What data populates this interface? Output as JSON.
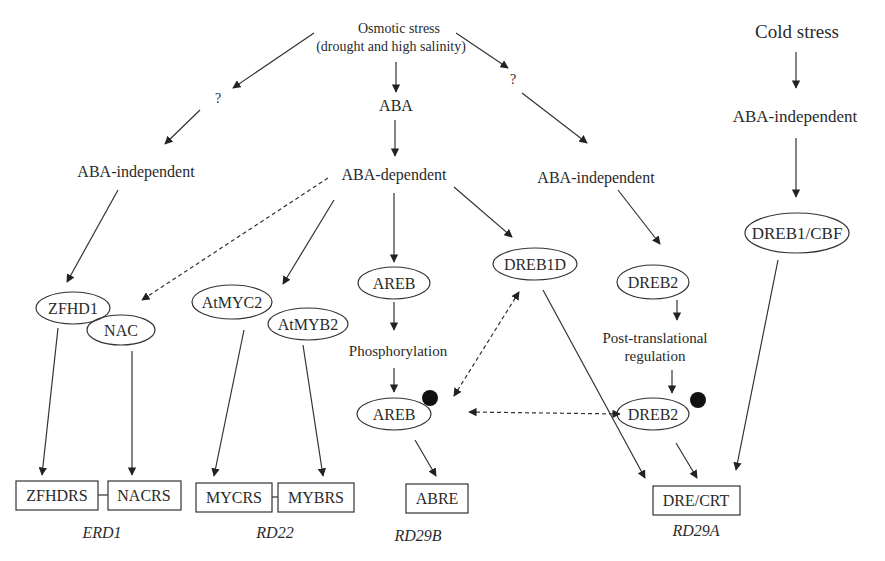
{
  "diagram": {
    "inputs": {
      "osmotic_line1": "Osmotic stress",
      "osmotic_line2": "(drought and high salinity)",
      "cold": "Cold stress"
    },
    "intermediates": {
      "q_left": "?",
      "q_right": "?",
      "aba": "ABA",
      "aba_independent_left": "ABA-independent",
      "aba_dependent": "ABA-dependent",
      "aba_independent_mid": "ABA-independent",
      "aba_independent_cold": "ABA-independent",
      "phosphorylation": "Phosphorylation",
      "post_trans_line1": "Post-translational",
      "post_trans_line2": "regulation"
    },
    "transcription_factors": {
      "zfhd1": "ZFHD1",
      "nac": "NAC",
      "atmyc2": "AtMYC2",
      "atmyb2": "AtMYB2",
      "areb": "AREB",
      "areb_p": "AREB",
      "dreb1d": "DREB1D",
      "dreb2": "DREB2",
      "dreb2_p": "DREB2",
      "dreb1_cbf": "DREB1/CBF"
    },
    "cis_elements": {
      "zfhdrs": "ZFHDRS",
      "nacrs": "NACRS",
      "mycrs": "MYCRS",
      "mybrs": "MYBRS",
      "abre": "ABRE",
      "dre_crt": "DRE/CRT"
    },
    "genes": {
      "erd1": "ERD1",
      "rd22": "RD22",
      "rd29b": "RD29B",
      "rd29a": "RD29A"
    },
    "legend_marks": {
      "phosphate_dot": "filled-circle = modification"
    },
    "colors": {
      "line": "#333333",
      "text": "#2a2a2a",
      "background": "#ffffff"
    }
  }
}
